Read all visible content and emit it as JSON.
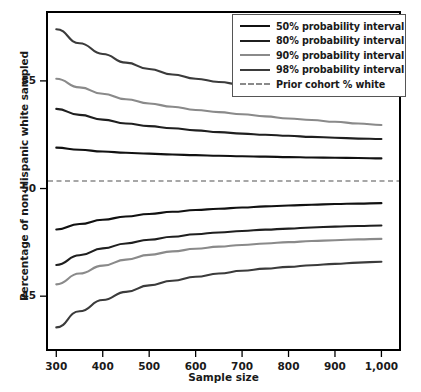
{
  "chart_data": {
    "type": "line",
    "title": "",
    "xlabel": "Sample size",
    "ylabel": "Percentage of non-Hispanic white sampled",
    "xlim": [
      280,
      1040
    ],
    "ylim": [
      42.5,
      58.2
    ],
    "xticks": [
      300,
      400,
      500,
      600,
      700,
      800,
      900,
      1000
    ],
    "xtick_labels": [
      "300",
      "400",
      "500",
      "600",
      "700",
      "800",
      "900",
      "1,000"
    ],
    "yticks": [
      45,
      50,
      55
    ],
    "ytick_labels": [
      "45",
      "50",
      "55"
    ],
    "grid": false,
    "legend_position": "top-right",
    "x": [
      300,
      350,
      400,
      450,
      500,
      550,
      600,
      650,
      700,
      750,
      800,
      850,
      900,
      950,
      1000
    ],
    "reference_line": {
      "label": "Prior cohort % white",
      "value": 50.35,
      "style": "dashed",
      "color": "#8a8a8a"
    },
    "series": [
      {
        "name": "98% probability interval",
        "bound": "upper",
        "color": "#3b3b3b",
        "values": [
          57.4,
          56.75,
          56.25,
          55.85,
          55.55,
          55.3,
          55.1,
          54.95,
          54.82,
          54.7,
          54.6,
          54.52,
          54.45,
          54.38,
          54.3
        ]
      },
      {
        "name": "90% probability interval",
        "bound": "upper",
        "color": "#8a8a8a",
        "values": [
          55.1,
          54.7,
          54.4,
          54.15,
          53.95,
          53.8,
          53.65,
          53.55,
          53.45,
          53.35,
          53.25,
          53.18,
          53.1,
          53.02,
          52.95
        ]
      },
      {
        "name": "80% probability interval",
        "bound": "upper",
        "color": "#1f1f1f",
        "values": [
          53.7,
          53.42,
          53.2,
          53.02,
          52.9,
          52.8,
          52.7,
          52.62,
          52.55,
          52.5,
          52.45,
          52.4,
          52.36,
          52.32,
          52.3
        ]
      },
      {
        "name": "50% probability interval",
        "bound": "upper",
        "color": "#111111",
        "values": [
          51.9,
          51.8,
          51.72,
          51.66,
          51.62,
          51.58,
          51.55,
          51.52,
          51.5,
          51.48,
          51.46,
          51.44,
          51.43,
          51.42,
          51.4
        ]
      },
      {
        "name": "50% probability interval",
        "bound": "lower",
        "color": "#111111",
        "values": [
          48.1,
          48.35,
          48.55,
          48.7,
          48.82,
          48.92,
          49.0,
          49.06,
          49.12,
          49.17,
          49.21,
          49.25,
          49.28,
          49.3,
          49.32
        ]
      },
      {
        "name": "80% probability interval",
        "bound": "lower",
        "color": "#1f1f1f",
        "values": [
          46.45,
          46.9,
          47.22,
          47.45,
          47.62,
          47.76,
          47.88,
          47.96,
          48.03,
          48.09,
          48.14,
          48.19,
          48.23,
          48.26,
          48.28
        ]
      },
      {
        "name": "90% probability interval",
        "bound": "lower",
        "color": "#8a8a8a",
        "values": [
          45.55,
          46.05,
          46.42,
          46.7,
          46.92,
          47.08,
          47.2,
          47.3,
          47.38,
          47.45,
          47.51,
          47.56,
          47.6,
          47.64,
          47.66
        ]
      },
      {
        "name": "98% probability interval",
        "bound": "lower",
        "color": "#3b3b3b",
        "values": [
          43.55,
          44.3,
          44.82,
          45.2,
          45.5,
          45.72,
          45.9,
          46.05,
          46.18,
          46.28,
          46.36,
          46.44,
          46.5,
          46.56,
          46.6
        ]
      }
    ],
    "legend": [
      {
        "label": "50% probability interval",
        "color": "#111111",
        "style": "solid"
      },
      {
        "label": "80% probability interval",
        "color": "#1f1f1f",
        "style": "solid"
      },
      {
        "label": "90% probability interval",
        "color": "#8a8a8a",
        "style": "solid"
      },
      {
        "label": "98% probability interval",
        "color": "#3b3b3b",
        "style": "solid"
      },
      {
        "label": "Prior cohort % white",
        "color": "#8a8a8a",
        "style": "dashed"
      }
    ]
  }
}
